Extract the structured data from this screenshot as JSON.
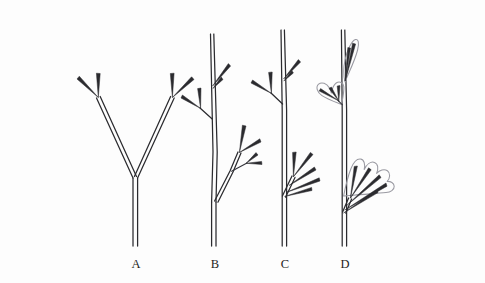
{
  "figure": {
    "background_color": "#fdfdfd",
    "ink_color": "#2b2b2f",
    "lamina_color": "#9a9aa2",
    "width": 485,
    "height": 283
  },
  "panels": [
    {
      "id": "A",
      "label": "A",
      "stage_name": "dichotomous-branching",
      "label_x": 136,
      "label_y": 268,
      "has_lamina": false,
      "description": "Equal dichotomous branching; main axis forks into two equal arms, each forking again"
    },
    {
      "id": "B",
      "label": "B",
      "stage_name": "overtopping",
      "label_x": 215,
      "label_y": 268,
      "has_lamina": false,
      "description": "Overtopping; one branch becomes dominant main axis, laterals subordinate"
    },
    {
      "id": "C",
      "label": "C",
      "stage_name": "planation",
      "label_x": 285,
      "label_y": 268,
      "has_lamina": false,
      "description": "Planation; lateral branch systems flattened into a single plane"
    },
    {
      "id": "D",
      "label": "D",
      "stage_name": "webbing",
      "label_x": 345,
      "label_y": 268,
      "has_lamina": true,
      "description": "Webbing; lamina tissue fills between planated branchlets forming leaf blades"
    }
  ],
  "leaves": [
    {
      "panel": "D",
      "name": "apical-leaf",
      "shape": "narrow-elongate",
      "position": "terminal apex"
    },
    {
      "panel": "D",
      "name": "upper-lateral-leaf",
      "shape": "bilobed-heart",
      "position": "upper left lateral"
    },
    {
      "panel": "D",
      "name": "lower-lateral-leaf",
      "shape": "fan-lobed",
      "position": "lower right lateral"
    }
  ]
}
